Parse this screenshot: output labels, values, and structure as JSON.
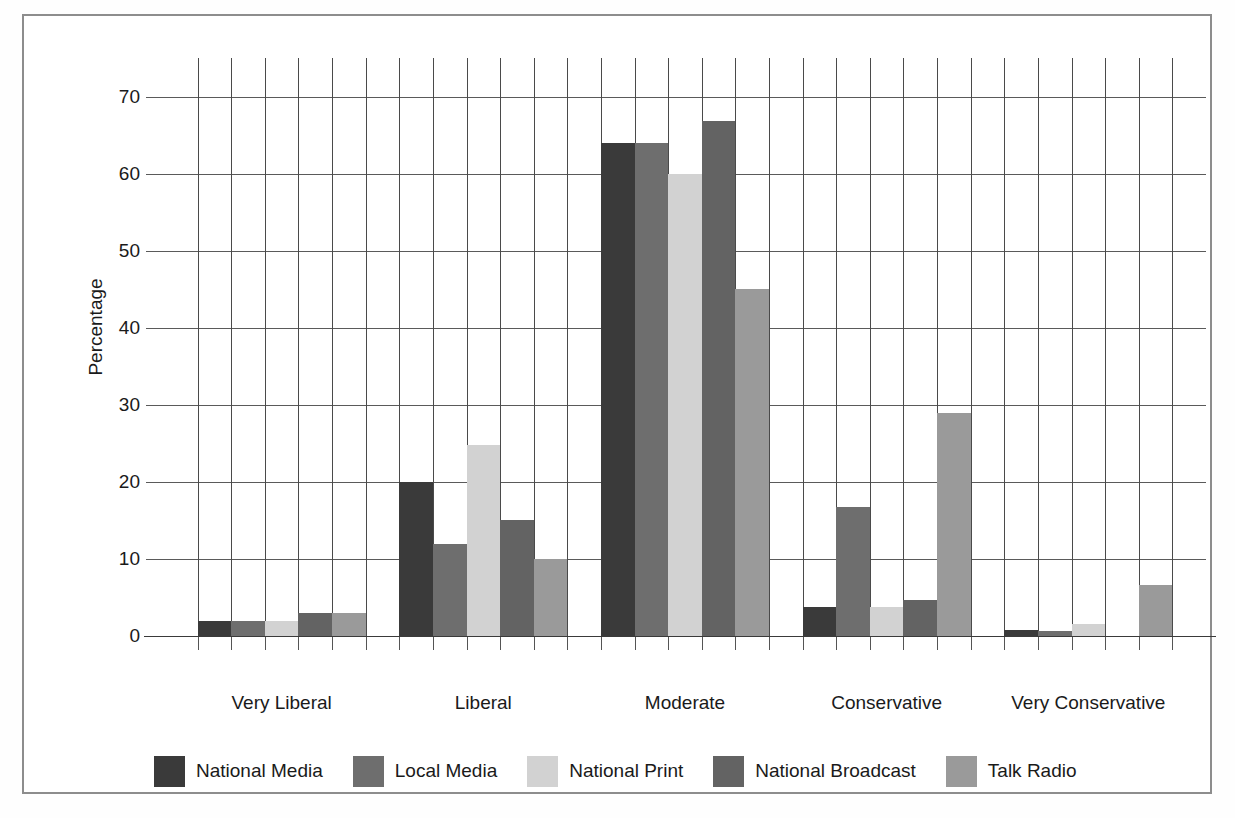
{
  "chart_data": {
    "type": "bar",
    "title": "",
    "subtitle": "",
    "xlabel": "",
    "ylabel": "Percentage",
    "categories": [
      "Very Liberal",
      "Liberal",
      "Moderate",
      "Conservative",
      "Very Conservative"
    ],
    "yticks": [
      0,
      10,
      20,
      30,
      40,
      50,
      60,
      70
    ],
    "ylim": [
      0,
      75
    ],
    "grid": "both",
    "legend_position": "bottom",
    "series": [
      {
        "name": "National Media",
        "color": "#3a3a3a",
        "values": [
          2,
          20,
          64,
          3.8,
          0.8
        ]
      },
      {
        "name": "Local Media",
        "color": "#6e6e6e",
        "values": [
          2,
          12,
          64,
          16.7,
          0.7
        ]
      },
      {
        "name": "National Print",
        "color": "#d2d2d2",
        "values": [
          2,
          24.8,
          60,
          3.8,
          1.6
        ]
      },
      {
        "name": "National Broadcast",
        "color": "#636363",
        "values": [
          3,
          15,
          66.8,
          4.7,
          0
        ]
      },
      {
        "name": "Talk Radio",
        "color": "#9a9a9a",
        "values": [
          3,
          10,
          45,
          29,
          6.6
        ]
      }
    ]
  },
  "figure": {
    "frame_color": "#8d8d8d",
    "background": "#ffffff"
  }
}
